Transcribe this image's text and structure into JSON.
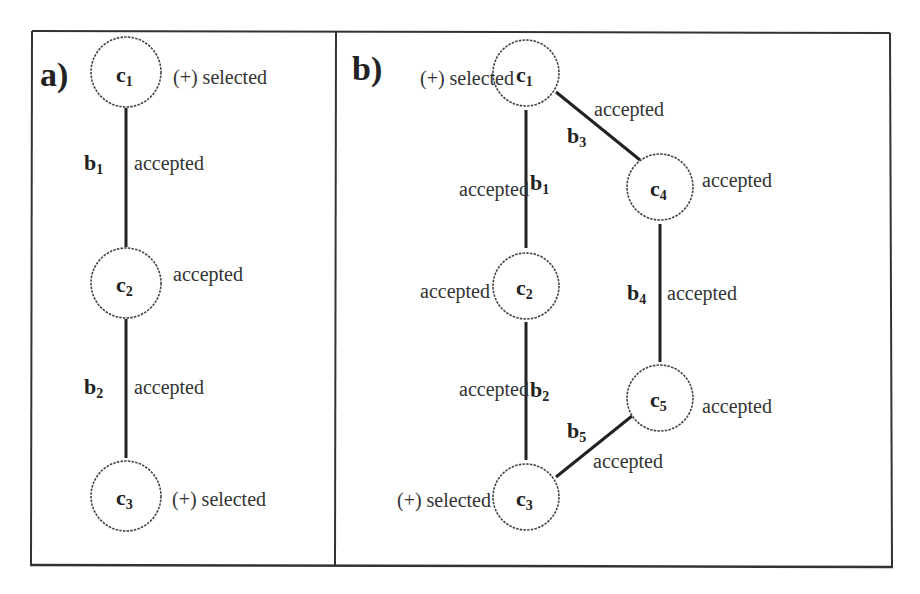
{
  "panels": [
    {
      "label": "a)",
      "nodes": [
        {
          "id": "c1",
          "base": "c",
          "sub": "1",
          "status": "(+) selected"
        },
        {
          "id": "c2",
          "base": "c",
          "sub": "2",
          "status": "accepted"
        },
        {
          "id": "c3",
          "base": "c",
          "sub": "3",
          "status": "(+) selected"
        }
      ],
      "edges": [
        {
          "id": "b1",
          "base": "b",
          "sub": "1",
          "from": "c1",
          "to": "c2",
          "status": "accepted"
        },
        {
          "id": "b2",
          "base": "b",
          "sub": "2",
          "from": "c2",
          "to": "c3",
          "status": "accepted"
        }
      ]
    },
    {
      "label": "b)",
      "nodes": [
        {
          "id": "c1",
          "base": "c",
          "sub": "1",
          "status": "(+) selected"
        },
        {
          "id": "c2",
          "base": "c",
          "sub": "2",
          "status": "accepted"
        },
        {
          "id": "c3",
          "base": "c",
          "sub": "3",
          "status": "(+) selected"
        },
        {
          "id": "c4",
          "base": "c",
          "sub": "4",
          "status": "accepted"
        },
        {
          "id": "c5",
          "base": "c",
          "sub": "5",
          "status": "accepted"
        }
      ],
      "edges": [
        {
          "id": "b1",
          "base": "b",
          "sub": "1",
          "from": "c1",
          "to": "c2",
          "status": "accepted"
        },
        {
          "id": "b2",
          "base": "b",
          "sub": "2",
          "from": "c2",
          "to": "c3",
          "status": "accepted"
        },
        {
          "id": "b3",
          "base": "b",
          "sub": "3",
          "from": "c1",
          "to": "c4",
          "status": "accepted"
        },
        {
          "id": "b4",
          "base": "b",
          "sub": "4",
          "from": "c4",
          "to": "c5",
          "status": "accepted"
        },
        {
          "id": "b5",
          "base": "b",
          "sub": "5",
          "from": "c5",
          "to": "c3",
          "status": "accepted"
        }
      ]
    }
  ]
}
